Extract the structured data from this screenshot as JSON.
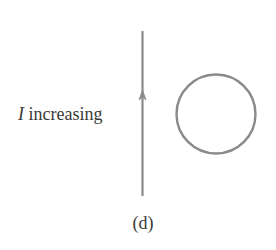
{
  "figure": {
    "current_label": {
      "symbol": "I",
      "text": " increasing"
    },
    "caption": "(d)",
    "colors": {
      "stroke": "#8a8a8a",
      "text": "#3a3a3a",
      "background": "#ffffff"
    },
    "elements": {
      "wire": {
        "orientation": "vertical",
        "current_direction": "up"
      },
      "loop": {
        "shape": "circle"
      }
    }
  }
}
